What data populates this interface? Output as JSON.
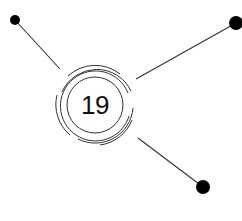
{
  "center": {
    "label": "19",
    "cx": 95,
    "cy": 105
  },
  "colors": {
    "stroke": "#333333",
    "dot": "#000000",
    "text": "#111111",
    "background": "#ffffff"
  },
  "nodes": [
    {
      "name": "top-left",
      "cx": 15,
      "cy": 20,
      "r": 5
    },
    {
      "name": "top-right",
      "cx": 236,
      "cy": 23,
      "r": 7
    },
    {
      "name": "bottom-right",
      "cx": 203,
      "cy": 187,
      "r": 7
    }
  ]
}
